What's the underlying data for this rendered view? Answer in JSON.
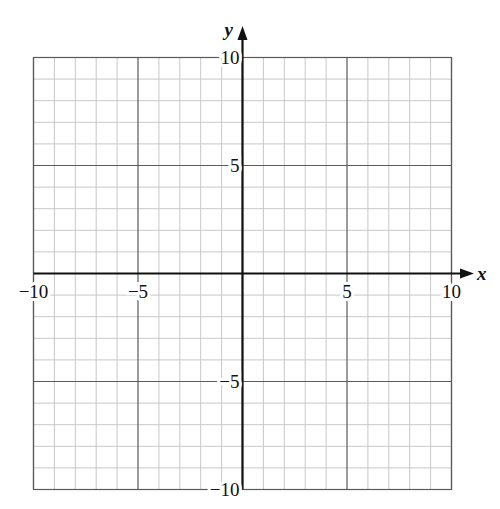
{
  "chart_data": {
    "type": "coordinate-grid",
    "title": "",
    "xlabel": "x",
    "ylabel": "y",
    "xlim": [
      -10,
      10
    ],
    "ylim": [
      -10,
      10
    ],
    "grid": true,
    "minor_step": 1,
    "major_step": 5,
    "x_tick_labels": [
      "−10",
      "−5",
      "5",
      "10"
    ],
    "x_tick_values": [
      -10,
      -5,
      5,
      10
    ],
    "y_tick_labels": [
      "10",
      "5",
      "−5",
      "−10"
    ],
    "y_tick_values": [
      10,
      5,
      -5,
      -10
    ],
    "series": []
  },
  "colors": {
    "minor_grid": "#c8c8c8",
    "major_grid": "#5a5a5a",
    "axis": "#111111"
  }
}
